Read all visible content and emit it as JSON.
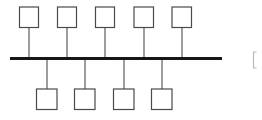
{
  "canvas": {
    "width": 262,
    "height": 120,
    "background": "#ffffff"
  },
  "diagram": {
    "type": "node-spine-diagram",
    "colors": {
      "spine": "#161616",
      "stem": "#4d4d4d",
      "box_border": "#4a4a4a",
      "box_fill": "#ffffff",
      "edge_mark": "#b6b6b6"
    },
    "spine": {
      "name": "horizontal-spine",
      "x1": 10,
      "y": 58.5,
      "x2": 222,
      "thickness": 3.2
    },
    "top_nodes": [
      {
        "id": "top-node-1",
        "label": "",
        "cx": 29,
        "box_x": 19.5,
        "box_y": 7.0,
        "box_w": 19.0,
        "box_h": 20.5,
        "stem_top": 27.5,
        "stem_bottom": 57.0
      },
      {
        "id": "top-node-2",
        "label": "",
        "cx": 67,
        "box_x": 57.5,
        "box_y": 7.0,
        "box_w": 19.0,
        "box_h": 20.5,
        "stem_top": 27.5,
        "stem_bottom": 57.0
      },
      {
        "id": "top-node-3",
        "label": "",
        "cx": 105,
        "box_x": 95.5,
        "box_y": 7.0,
        "box_w": 19.0,
        "box_h": 20.5,
        "stem_top": 27.5,
        "stem_bottom": 57.0
      },
      {
        "id": "top-node-4",
        "label": "",
        "cx": 144,
        "box_x": 134.0,
        "box_y": 7.0,
        "box_w": 19.5,
        "box_h": 20.5,
        "stem_top": 27.5,
        "stem_bottom": 57.0
      },
      {
        "id": "top-node-5",
        "label": "",
        "cx": 182,
        "box_x": 172.0,
        "box_y": 7.0,
        "box_w": 19.5,
        "box_h": 20.5,
        "stem_top": 27.5,
        "stem_bottom": 57.0
      }
    ],
    "bottom_nodes": [
      {
        "id": "bottom-node-1",
        "label": "",
        "cx": 47,
        "box_x": 36.5,
        "box_y": 89.0,
        "box_w": 20.5,
        "box_h": 20.5,
        "stem_top": 60.0,
        "stem_bottom": 89.0
      },
      {
        "id": "bottom-node-2",
        "label": "",
        "cx": 85,
        "box_x": 74.5,
        "box_y": 89.0,
        "box_w": 20.5,
        "box_h": 20.5,
        "stem_top": 60.0,
        "stem_bottom": 89.0
      },
      {
        "id": "bottom-node-3",
        "label": "",
        "cx": 124,
        "box_x": 113.5,
        "box_y": 89.0,
        "box_w": 20.5,
        "box_h": 20.5,
        "stem_top": 60.0,
        "stem_bottom": 89.0
      },
      {
        "id": "bottom-node-4",
        "label": "",
        "cx": 162,
        "box_x": 151.5,
        "box_y": 89.0,
        "box_w": 20.5,
        "box_h": 20.5,
        "stem_top": 60.0,
        "stem_bottom": 89.0
      }
    ],
    "edge_marks": [
      {
        "id": "right-bracket-mark",
        "x": 253.5,
        "y1": 52.0,
        "y2": 68.0,
        "tick": 3.0
      }
    ],
    "counts": {
      "top_nodes": 5,
      "bottom_nodes": 4,
      "total_nodes": 9
    }
  }
}
